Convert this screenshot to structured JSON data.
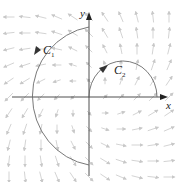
{
  "diagram": {
    "colors": {
      "axis": "#3a3a3a",
      "curve": "#6a6a6a",
      "field": "#c8c8c8",
      "background": "#ffffff"
    },
    "axes": {
      "x_label": "x",
      "y_label": "y",
      "origin_px": [
        89,
        97
      ]
    },
    "curves": [
      {
        "name": "C1",
        "label_main": "C",
        "label_sub": "1",
        "shape": "left semicircle centered at origin",
        "radius_px": 68,
        "orientation": "counterclockwise, from top of y-axis to bottom"
      },
      {
        "name": "C2",
        "label_main": "C",
        "label_sub": "2",
        "shape": "upper semicircle on positive x-axis",
        "center_px": [
          123,
          97
        ],
        "radius_px": 34,
        "orientation": "clockwise, from origin over to positive x-axis"
      }
    ],
    "vector_field": {
      "description": "F(x,y) direction ~ (x - y, x + y), spiralling outward counterclockwise",
      "grid_spacing_px": 16
    }
  }
}
